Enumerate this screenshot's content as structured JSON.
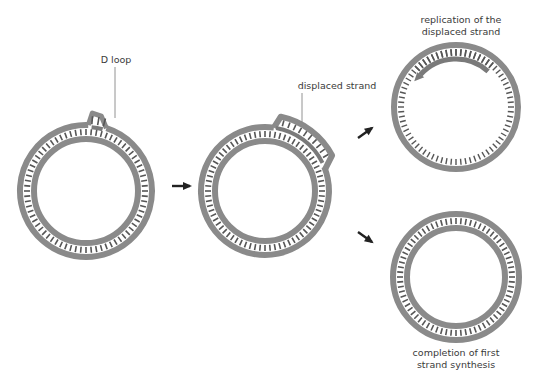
{
  "colors": {
    "strand": "#8a8a8a",
    "ticks": "#555555",
    "new_strand": "#7a7a7a",
    "arrow": "#222222",
    "leader": "#777777",
    "text": "#3a3a3a"
  },
  "stages": [
    {
      "id": "stage-1",
      "name": "initial D loop",
      "label": "D loop"
    },
    {
      "id": "stage-2",
      "name": "strand displacement",
      "label": "displaced strand"
    },
    {
      "id": "stage-3a",
      "name": "second strand replication",
      "label_lines": [
        "replication of the",
        "displaced strand"
      ]
    },
    {
      "id": "stage-3b",
      "name": "first strand completion",
      "label_lines": [
        "completion of first",
        "strand synthesis"
      ]
    }
  ],
  "arrows": [
    {
      "from": "stage-1",
      "to": "stage-2",
      "direction": "right"
    },
    {
      "from": "stage-2",
      "to": "stage-3a",
      "direction": "up-right"
    },
    {
      "from": "stage-2",
      "to": "stage-3b",
      "direction": "down-right"
    }
  ]
}
